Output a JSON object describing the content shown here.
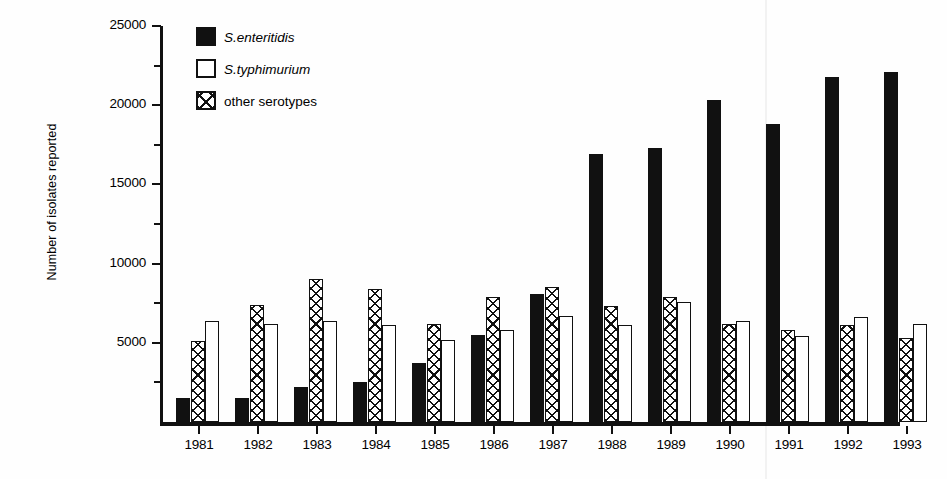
{
  "chart_data": {
    "type": "bar",
    "title": "",
    "subtitle": "",
    "xlabel": "",
    "ylabel": "Number of isolates reported",
    "ylim": [
      0,
      25000
    ],
    "ytick_values": [
      0,
      5000,
      10000,
      15000,
      20000,
      25000
    ],
    "ytick_labels": [
      "",
      "5000",
      "10000",
      "15000",
      "20000",
      "25000"
    ],
    "yminor_step": 2500,
    "grid": false,
    "legend_position": "upper-left-inside",
    "categories": [
      "1981",
      "1982",
      "1983",
      "1984",
      "1985",
      "1986",
      "1987",
      "1988",
      "1989",
      "1990",
      "1991",
      "1992",
      "1993"
    ],
    "series": [
      {
        "name": "S.enteritidis",
        "style": "solid",
        "italic": true,
        "values": [
          1500,
          1500,
          2200,
          2500,
          3700,
          5500,
          8100,
          16900,
          17300,
          20300,
          18800,
          21800,
          22100
        ]
      },
      {
        "name": "S.typhimurium",
        "style": "open",
        "italic": true,
        "values": [
          6400,
          6200,
          6400,
          6100,
          5200,
          5800,
          6700,
          6100,
          7600,
          6400,
          5400,
          6600,
          6200
        ]
      },
      {
        "name": "other serotypes",
        "style": "hatch",
        "italic": false,
        "values": [
          5100,
          7400,
          9000,
          8400,
          6200,
          7900,
          8500,
          7300,
          7900,
          6200,
          5800,
          6100,
          5300
        ]
      }
    ],
    "series_draw_order": [
      "S.enteritidis",
      "other serotypes",
      "S.typhimurium"
    ]
  }
}
